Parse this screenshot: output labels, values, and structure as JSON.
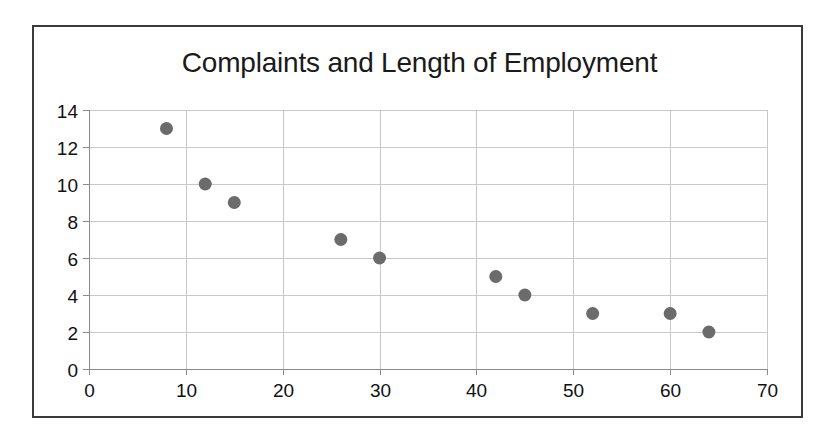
{
  "figure": {
    "background_color": "#ffffff",
    "border_color": "#3a3a3a"
  },
  "chart_data": {
    "type": "scatter",
    "title": "Complaints and Length of Employment",
    "subtitle": "",
    "xlabel": "",
    "ylabel": "",
    "xlim": [
      0,
      70
    ],
    "ylim": [
      0,
      14
    ],
    "xticks": [
      0,
      10,
      20,
      30,
      40,
      50,
      60,
      70
    ],
    "yticks": [
      0,
      2,
      4,
      6,
      8,
      10,
      12,
      14
    ],
    "xtick_labels": [
      "0",
      "10",
      "20",
      "30",
      "40",
      "50",
      "60",
      "70"
    ],
    "ytick_labels": [
      "0",
      "2",
      "4",
      "6",
      "8",
      "10",
      "12",
      "14"
    ],
    "grid": {
      "horizontal": true,
      "vertical": true,
      "color": "#c9c9c9"
    },
    "legend": {
      "visible": false,
      "position": "none",
      "entries": []
    },
    "marker": {
      "shape": "circle",
      "color": "#6b6b6b",
      "size_px": 13
    },
    "points": [
      {
        "x": 8,
        "y": 13
      },
      {
        "x": 12,
        "y": 10
      },
      {
        "x": 15,
        "y": 9
      },
      {
        "x": 26,
        "y": 7
      },
      {
        "x": 30,
        "y": 6
      },
      {
        "x": 42,
        "y": 5
      },
      {
        "x": 45,
        "y": 4
      },
      {
        "x": 52,
        "y": 3
      },
      {
        "x": 60,
        "y": 3
      },
      {
        "x": 64,
        "y": 2
      }
    ],
    "series": [
      {
        "name": "Complaints",
        "x": [
          8,
          12,
          15,
          26,
          30,
          42,
          45,
          52,
          60,
          64
        ],
        "values": [
          13,
          10,
          9,
          7,
          6,
          5,
          4,
          3,
          3,
          2
        ]
      }
    ]
  }
}
